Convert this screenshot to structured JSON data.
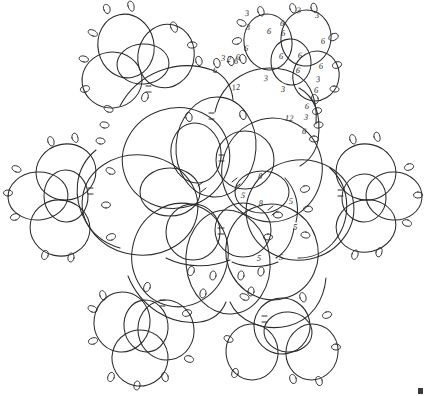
{
  "document": {
    "title": "Tatted Snowflake Motif Pattern Diagram",
    "medium": "hand-drawn ink line diagram",
    "background_color": "#ffffff",
    "ink_color": "#2b2b2b",
    "symmetry": "five-fold radial",
    "width_px": 425,
    "height_px": 396
  },
  "legend": {
    "ring_label": "ring",
    "chain_label": "chain",
    "picot_label": "picot",
    "join_label": "join bar"
  },
  "stitch_counts": [
    {
      "id": "c1",
      "text": "3",
      "x": 247,
      "y": 14,
      "note": "outer ring top picot count"
    },
    {
      "id": "c2",
      "text": "3",
      "x": 299,
      "y": 11,
      "note": "outer ring top picot count"
    },
    {
      "id": "c3",
      "text": "3",
      "x": 317,
      "y": 16,
      "note": "outer ring top picot count"
    },
    {
      "id": "c4",
      "text": "3",
      "x": 248,
      "y": 28,
      "note": "ring side count"
    },
    {
      "id": "c5",
      "text": "6",
      "x": 269,
      "y": 32,
      "note": "ring stitch count"
    },
    {
      "id": "c6",
      "text": "6",
      "x": 282,
      "y": 24,
      "note": "ring stitch count"
    },
    {
      "id": "c7",
      "text": "6",
      "x": 283,
      "y": 34,
      "note": "ring stitch count"
    },
    {
      "id": "c8",
      "text": "6",
      "x": 323,
      "y": 42,
      "note": "ring stitch count"
    },
    {
      "id": "c9",
      "text": "6",
      "x": 281,
      "y": 57,
      "note": "center small ring count"
    },
    {
      "id": "c10",
      "text": "6",
      "x": 300,
      "y": 56,
      "note": "center small ring count"
    },
    {
      "id": "c11",
      "text": "6",
      "x": 246,
      "y": 49,
      "note": "left ring count"
    },
    {
      "id": "c12",
      "text": "6",
      "x": 298,
      "y": 71,
      "note": "lower small ring count"
    },
    {
      "id": "c13",
      "text": "6",
      "x": 238,
      "y": 58,
      "note": "chain picot count"
    },
    {
      "id": "c14",
      "text": "6",
      "x": 236,
      "y": 62,
      "note": "chain picot count"
    },
    {
      "id": "c15",
      "text": "3",
      "x": 223,
      "y": 59,
      "note": "chain picot count"
    },
    {
      "id": "c16",
      "text": "2",
      "x": 229,
      "y": 60,
      "note": "chain picot count"
    },
    {
      "id": "c17",
      "text": "6",
      "x": 215,
      "y": 71,
      "note": "chain picot count"
    },
    {
      "id": "c18",
      "text": "12",
      "x": 236,
      "y": 88,
      "note": "long chain stitch count"
    },
    {
      "id": "c19",
      "text": "3",
      "x": 266,
      "y": 79,
      "note": "chain segment count"
    },
    {
      "id": "c20",
      "text": "3",
      "x": 283,
      "y": 90,
      "note": "chain segment count"
    },
    {
      "id": "c21",
      "text": "6",
      "x": 307,
      "y": 107,
      "note": "right chain picot count"
    },
    {
      "id": "c22",
      "text": "3",
      "x": 306,
      "y": 118,
      "note": "right chain picot count"
    },
    {
      "id": "c23",
      "text": "6",
      "x": 304,
      "y": 132,
      "note": "right chain picot count"
    },
    {
      "id": "c24",
      "text": "3",
      "x": 318,
      "y": 80,
      "note": "right ring count"
    },
    {
      "id": "c25",
      "text": "6",
      "x": 321,
      "y": 67,
      "note": "right ring count"
    },
    {
      "id": "c26",
      "text": "6",
      "x": 316,
      "y": 91,
      "note": "right ring count"
    },
    {
      "id": "c27",
      "text": "12",
      "x": 289,
      "y": 119,
      "note": "long chain stitch count"
    },
    {
      "id": "c28",
      "text": "8",
      "x": 260,
      "y": 177,
      "note": "center ring top count"
    },
    {
      "id": "c29",
      "text": "5",
      "x": 243,
      "y": 196,
      "note": "center ring left count"
    },
    {
      "id": "c30",
      "text": "8",
      "x": 261,
      "y": 204,
      "note": "center ring bottom count"
    },
    {
      "id": "c31",
      "text": "5",
      "x": 291,
      "y": 202,
      "note": "inner chain count"
    },
    {
      "id": "c32",
      "text": "5",
      "x": 295,
      "y": 228,
      "note": "inner chain count"
    },
    {
      "id": "c33",
      "text": "5",
      "x": 259,
      "y": 259,
      "note": "inner chain count"
    },
    {
      "id": "c34",
      "text": "5",
      "x": 281,
      "y": 258,
      "note": "inner chain count"
    }
  ],
  "clusters": [
    {
      "name": "top-left-clover",
      "position": "top left",
      "ring_count": 3
    },
    {
      "name": "top-right-clover",
      "position": "top right",
      "ring_count": 3
    },
    {
      "name": "left-clover",
      "position": "left",
      "ring_count": 3
    },
    {
      "name": "right-clover",
      "position": "right",
      "ring_count": 3
    },
    {
      "name": "bottom-left-clover",
      "position": "bottom left",
      "ring_count": 3
    },
    {
      "name": "bottom-right-clover",
      "position": "bottom right",
      "ring_count": 3
    }
  ],
  "corner_mark": {
    "present": true,
    "text": "",
    "x": 419,
    "y": 390
  }
}
